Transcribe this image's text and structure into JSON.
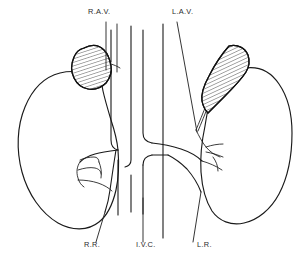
{
  "diagram": {
    "background_color": "#ffffff",
    "ink_color": "#1a1a1a",
    "label_color": "#2b2b2b",
    "labels": [
      {
        "id": "right-adrenal-vein",
        "text": "R.A.V.",
        "meaning": "Right adrenal vein",
        "x": 88,
        "y": 14,
        "position": "top-left"
      },
      {
        "id": "left-adrenal-vein",
        "text": "L.A.V.",
        "meaning": "Left adrenal vein",
        "x": 172,
        "y": 14,
        "position": "top-right"
      },
      {
        "id": "right-renal-vein",
        "text": "R.R.",
        "meaning": "Right renal vein",
        "x": 84,
        "y": 247,
        "position": "bottom-left"
      },
      {
        "id": "inferior-vena-cava",
        "text": "I.V.C.",
        "meaning": "Inferior vena cava",
        "x": 136,
        "y": 247,
        "position": "bottom-center"
      },
      {
        "id": "left-renal-vein",
        "text": "L.R.",
        "meaning": "Left renal vein",
        "x": 197,
        "y": 247,
        "position": "bottom-right"
      }
    ],
    "structures": [
      {
        "id": "right-kidney",
        "name": "Right kidney",
        "style": "outline",
        "side": "left-of-image"
      },
      {
        "id": "left-kidney",
        "name": "Left kidney",
        "style": "outline",
        "side": "right-of-image"
      },
      {
        "id": "right-adrenal-gland",
        "name": "Right adrenal gland",
        "style": "hatched",
        "shape": "triangular-cap"
      },
      {
        "id": "left-adrenal-gland",
        "name": "Left adrenal gland",
        "style": "hatched",
        "shape": "crescent-cap"
      },
      {
        "id": "inferior-vena-cava-vessel",
        "name": "Inferior vena cava",
        "style": "tube"
      },
      {
        "id": "aorta-vessel",
        "name": "Aorta",
        "style": "tube"
      },
      {
        "id": "right-renal-vessels",
        "name": "Right renal vessel branches",
        "style": "branching"
      },
      {
        "id": "left-renal-vessels",
        "name": "Left renal vessel branches",
        "style": "branching"
      }
    ]
  }
}
